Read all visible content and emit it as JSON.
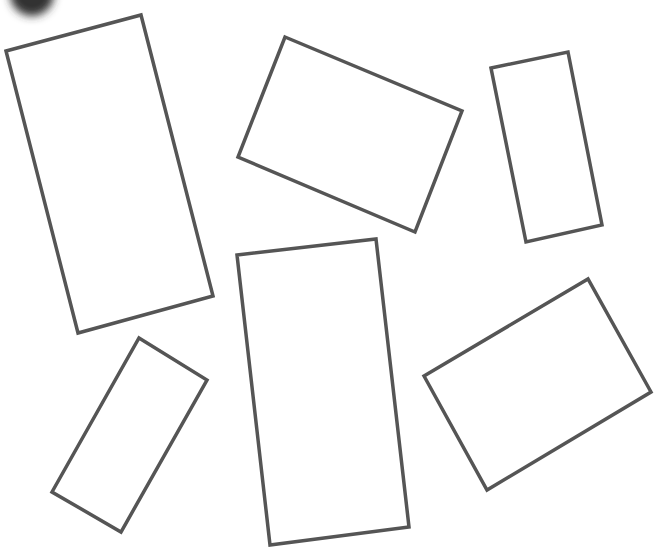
{
  "canvas": {
    "width": 666,
    "height": 560,
    "background": "#ffffff"
  },
  "style": {
    "stroke": "#555555",
    "stroke_width": 3.5
  },
  "blob": {
    "cx": 32,
    "cy": -6,
    "r": 22,
    "color": "#333333"
  },
  "rectangles": [
    {
      "id": "rect-1",
      "points": [
        [
          6,
          51
        ],
        [
          141,
          15
        ],
        [
          213,
          296
        ],
        [
          78,
          333
        ]
      ]
    },
    {
      "id": "rect-2",
      "points": [
        [
          285,
          37
        ],
        [
          462,
          111
        ],
        [
          415,
          232
        ],
        [
          238,
          157
        ]
      ]
    },
    {
      "id": "rect-3",
      "points": [
        [
          491,
          68
        ],
        [
          568,
          52
        ],
        [
          602,
          225
        ],
        [
          526,
          242
        ]
      ]
    },
    {
      "id": "rect-4",
      "points": [
        [
          139,
          338
        ],
        [
          207,
          380
        ],
        [
          121,
          532
        ],
        [
          52,
          492
        ]
      ]
    },
    {
      "id": "rect-5",
      "points": [
        [
          237,
          255
        ],
        [
          376,
          239
        ],
        [
          409,
          527
        ],
        [
          270,
          545
        ]
      ]
    },
    {
      "id": "rect-6",
      "points": [
        [
          424,
          376
        ],
        [
          588,
          279
        ],
        [
          651,
          392
        ],
        [
          487,
          490
        ]
      ]
    }
  ]
}
